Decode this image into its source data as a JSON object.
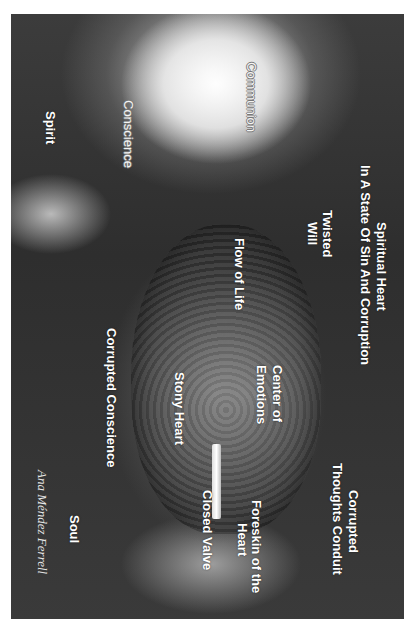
{
  "diagram": {
    "title_line1": "Spiritual Heart",
    "title_line2": "In A State Of Sin And Corruption",
    "orientation": "rotated 90° clockwise",
    "labels": {
      "communion": "Communion",
      "conscience": "Conscience",
      "spirit": "Spirit",
      "twisted_will_1": "Twisted",
      "twisted_will_2": "Will",
      "flow_of_life": "Flow of Life",
      "center_of_emotions_1": "Center of",
      "center_of_emotions_2": "Emotions",
      "stony_heart": "Stony Heart",
      "corrupted_conscience": "Corrupted Conscience",
      "corrupted_thoughts_1": "Corrupted",
      "corrupted_thoughts_2": "Thoughts Conduit",
      "foreskin_1": "Foreskin of the",
      "foreskin_2": "Heart",
      "closed_valve": "Closed Valve",
      "soul": "Soul"
    },
    "signature": "Ana Méndez Ferrell",
    "colors": {
      "label_text": "#ffffff",
      "background_dark": "#333333",
      "page_background": "#ffffff"
    }
  }
}
